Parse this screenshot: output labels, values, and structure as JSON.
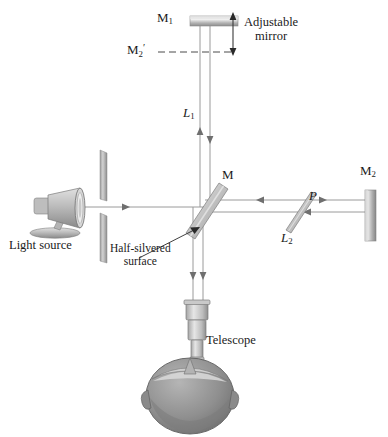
{
  "figure": {
    "background_color": "#ffffff",
    "width": 388,
    "height": 437
  },
  "labels": {
    "mirror_adjustable": "M",
    "mirror_adjustable_sub": "1",
    "mirror_virtual": "M",
    "mirror_virtual_sub": "2",
    "mirror_virtual_prime": "′",
    "adjustable_line1": "Adjustable",
    "adjustable_line2": "mirror",
    "arm_length_1": "L",
    "arm_length_1_sub": "1",
    "arm_length_2": "L",
    "arm_length_2_sub": "2",
    "beam_splitter": "M",
    "mirror_fixed": "M",
    "mirror_fixed_sub": "2",
    "compensator": "P",
    "light_source": "Light source",
    "half_silvered_line1": "Half-silvered",
    "half_silvered_line2": "surface",
    "telescope": "Telescope"
  },
  "colors": {
    "ink": "#1a1a1a",
    "beam": "#8a8a8a",
    "mirror_light": "#d8d8d8",
    "mirror_mid": "#a8a8a8",
    "mirror_dark": "#7d7d7d",
    "lamp_body": "#b5b5b5",
    "head_fill": "#8f8f8f",
    "plate_glass": "#c4c4c4"
  },
  "optical_elements": [
    {
      "name": "adjustable-mirror-m1",
      "type": "mirror",
      "orientation": "horizontal",
      "x": 190,
      "y": 16,
      "w": 48,
      "h": 10
    },
    {
      "name": "virtual-mirror-m2-prime",
      "type": "dashed-reference-line",
      "orientation": "horizontal",
      "x1": 160,
      "x2": 232,
      "y": 52
    },
    {
      "name": "beam-splitter-m",
      "type": "half-silvered-plate",
      "angle_deg": 45,
      "cx": 205,
      "cy": 207
    },
    {
      "name": "compensator-plate-p",
      "type": "glass-plate",
      "angle_deg": 45,
      "cx": 300,
      "cy": 209
    },
    {
      "name": "fixed-mirror-m2",
      "type": "mirror",
      "orientation": "vertical",
      "x": 365,
      "y": 190,
      "w": 11,
      "h": 51
    },
    {
      "name": "aperture-slit",
      "type": "aperture",
      "x": 100,
      "y_top_bar": [
        150,
        200
      ],
      "y_bottom_bar": [
        213,
        263
      ]
    },
    {
      "name": "light-source-lamp",
      "type": "lamp",
      "cx": 62,
      "cy": 209
    },
    {
      "name": "telescope",
      "type": "telescope",
      "cx": 197,
      "y_top": 300,
      "y_bottom": 372
    },
    {
      "name": "observer-head",
      "type": "head-top-view",
      "cx": 190,
      "cy": 395
    }
  ],
  "beams": [
    {
      "name": "source-to-splitter",
      "from": [
        85,
        207
      ],
      "to": [
        205,
        207
      ],
      "direction": "right"
    },
    {
      "name": "splitter-to-m1",
      "axis": "vertical",
      "x_left": 200,
      "x_right": 210,
      "y_top": 26,
      "y_bottom": 207,
      "direction": "both"
    },
    {
      "name": "splitter-to-m2",
      "axis": "horizontal",
      "y_upper": 200,
      "y_lower": 212,
      "x_left": 205,
      "x_right": 365,
      "direction": "both"
    },
    {
      "name": "splitter-to-telescope",
      "axis": "vertical",
      "x_left": 193,
      "x_right": 203,
      "y_top": 207,
      "y_bottom": 305,
      "direction": "down"
    }
  ]
}
